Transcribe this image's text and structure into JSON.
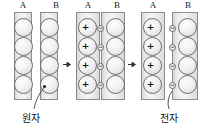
{
  "diagram": {
    "colors": {
      "plate_fill": "#f0f0f0",
      "plate_stroke": "#8c8c8c",
      "circle_stroke": "#6f6f6f",
      "text": "#111111"
    },
    "panels": [
      {
        "id": "panel-1",
        "plates": [
          {
            "id": "plate-a1",
            "label": "A",
            "particles": [
              {
                "kind": "atom",
                "sign": ""
              },
              {
                "kind": "atom",
                "sign": ""
              },
              {
                "kind": "atom",
                "sign": ""
              },
              {
                "kind": "atom",
                "sign": ""
              }
            ]
          },
          {
            "id": "plate-b1",
            "label": "B",
            "particles": [
              {
                "kind": "atom",
                "sign": ""
              },
              {
                "kind": "atom",
                "sign": ""
              },
              {
                "kind": "atom",
                "sign": ""
              },
              {
                "kind": "atom",
                "sign": ""
              }
            ]
          }
        ]
      },
      {
        "id": "panel-2",
        "plates": [
          {
            "id": "plate-a2",
            "label": "A",
            "particles": [
              {
                "kind": "ion",
                "sign": "+",
                "electron": "right"
              },
              {
                "kind": "ion",
                "sign": "+",
                "electron": "right"
              },
              {
                "kind": "ion",
                "sign": "+",
                "electron": "right"
              },
              {
                "kind": "ion",
                "sign": "+",
                "electron": "right"
              }
            ]
          },
          {
            "id": "plate-b2",
            "label": "B",
            "particles": [
              {
                "kind": "atom",
                "sign": "",
                "electron": "left"
              },
              {
                "kind": "atom",
                "sign": "",
                "electron": "left"
              },
              {
                "kind": "atom",
                "sign": "",
                "electron": "left"
              },
              {
                "kind": "atom",
                "sign": "",
                "electron": "left"
              }
            ]
          }
        ]
      },
      {
        "id": "panel-3",
        "plates": [
          {
            "id": "plate-a3",
            "label": "A",
            "particles": [
              {
                "kind": "ion",
                "sign": "+",
                "electron": "right"
              },
              {
                "kind": "ion",
                "sign": "+",
                "electron": "right"
              },
              {
                "kind": "ion",
                "sign": "+",
                "electron": "right"
              },
              {
                "kind": "ion",
                "sign": "+",
                "electron": "right"
              }
            ]
          },
          {
            "id": "plate-b3",
            "label": "B",
            "particles": [
              {
                "kind": "atom",
                "sign": "",
                "electron": "left"
              },
              {
                "kind": "atom",
                "sign": "",
                "electron": "left"
              },
              {
                "kind": "atom",
                "sign": "",
                "electron": "left"
              },
              {
                "kind": "atom",
                "sign": "",
                "electron": "left"
              }
            ]
          }
        ]
      }
    ],
    "electron_sign": "−",
    "arrows": [
      {
        "id": "arrow-1",
        "glyph": "right-arrow"
      },
      {
        "id": "arrow-2",
        "glyph": "right-arrow"
      }
    ],
    "callouts": [
      {
        "id": "callout-atom",
        "label": "원자"
      },
      {
        "id": "callout-electron",
        "label": "전자"
      }
    ]
  }
}
